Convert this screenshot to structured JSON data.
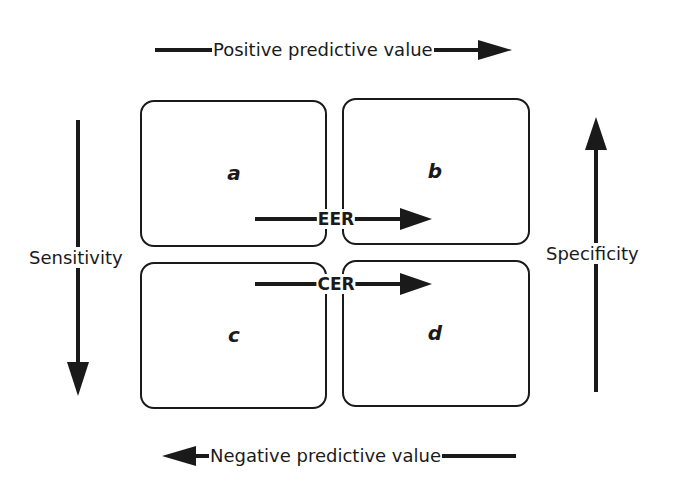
{
  "diagram": {
    "top_axis": {
      "label": "Positive predictive value",
      "direction": "right"
    },
    "bottom_axis": {
      "label": "Negative predictive value",
      "direction": "left"
    },
    "left_axis": {
      "label": "Sensitivity",
      "direction": "down"
    },
    "right_axis": {
      "label": "Specificity",
      "direction": "up"
    },
    "cells": [
      {
        "id": "a",
        "label": "a"
      },
      {
        "id": "b",
        "label": "b"
      },
      {
        "id": "c",
        "label": "c"
      },
      {
        "id": "d",
        "label": "d"
      }
    ],
    "rates": [
      {
        "label": "EER",
        "direction": "right"
      },
      {
        "label": "CER",
        "direction": "right"
      }
    ],
    "colors": {
      "stroke": "#1a1a1a",
      "background": "#ffffff"
    }
  }
}
